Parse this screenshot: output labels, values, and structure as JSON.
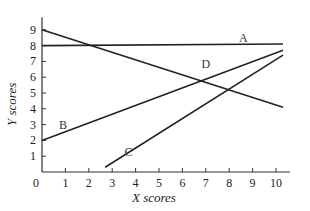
{
  "chart_data": {
    "type": "line",
    "title": "",
    "xlabel": "X scores",
    "ylabel": "Y scores",
    "xlim": [
      0,
      10.5
    ],
    "ylim": [
      0,
      10
    ],
    "x_ticks": [
      "0",
      "1",
      "2",
      "3",
      "4",
      "5",
      "6",
      "7",
      "8",
      "9",
      "10"
    ],
    "y_ticks": [
      "1",
      "2",
      "3",
      "4",
      "5",
      "6",
      "7",
      "8",
      "9"
    ],
    "grid": false,
    "series": [
      {
        "name": "A",
        "points": [
          [
            0,
            8.0
          ],
          [
            10.3,
            8.1
          ]
        ]
      },
      {
        "name": "B",
        "points": [
          [
            0,
            2.0
          ],
          [
            10.3,
            7.7
          ]
        ]
      },
      {
        "name": "C",
        "points": [
          [
            2.7,
            0.3
          ],
          [
            10.3,
            7.4
          ]
        ]
      },
      {
        "name": "D",
        "points": [
          [
            0,
            9.0
          ],
          [
            10.3,
            4.1
          ]
        ]
      }
    ],
    "annotations": [
      {
        "text": "A",
        "x": 8.6,
        "y": 8.2
      },
      {
        "text": "B",
        "x": 0.9,
        "y": 2.7
      },
      {
        "text": "C",
        "x": 3.7,
        "y": 1.0
      },
      {
        "text": "D",
        "x": 7.0,
        "y": 6.6
      }
    ]
  }
}
